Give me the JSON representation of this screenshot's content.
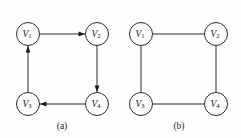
{
  "figure": {
    "background_color": "#fefefe",
    "stroke_color": "#2b2b2b",
    "text_color": "#151515",
    "panels": [
      {
        "id": "panel-a",
        "caption": "(a)",
        "graph_type": "directed",
        "nodes": [
          {
            "id": "V1",
            "label_main": "V",
            "label_sub": "1",
            "cx": 28,
            "cy": 34,
            "r": 11.5
          },
          {
            "id": "V2",
            "label_main": "V",
            "label_sub": "2",
            "cx": 97,
            "cy": 34,
            "r": 11.5
          },
          {
            "id": "V3",
            "label_main": "V",
            "label_sub": "3",
            "cx": 28,
            "cy": 104,
            "r": 11.5
          },
          {
            "id": "V4",
            "label_main": "V",
            "label_sub": "4",
            "cx": 97,
            "cy": 104,
            "r": 11.5
          }
        ],
        "edges": [
          {
            "id": "e-v1-v2",
            "from": "V1",
            "to": "V2",
            "directed": true,
            "arrow_at": "to"
          },
          {
            "id": "e-v2-v4",
            "from": "V2",
            "to": "V4",
            "directed": true,
            "arrow_at": "to"
          },
          {
            "id": "e-v4-v3",
            "from": "V4",
            "to": "V3",
            "directed": true,
            "arrow_at": "to"
          },
          {
            "id": "e-v3-v1",
            "from": "V3",
            "to": "V1",
            "directed": true,
            "arrow_at": "to"
          }
        ],
        "caption_x": 62,
        "caption_y": 127
      },
      {
        "id": "panel-b",
        "caption": "(b)",
        "graph_type": "undirected",
        "nodes": [
          {
            "id": "V1",
            "label_main": "V",
            "label_sub": "1",
            "cx": 141,
            "cy": 34,
            "r": 11.5
          },
          {
            "id": "V2",
            "label_main": "V",
            "label_sub": "2",
            "cx": 216,
            "cy": 34,
            "r": 11.5
          },
          {
            "id": "V3",
            "label_main": "V",
            "label_sub": "3",
            "cx": 141,
            "cy": 104,
            "r": 11.5
          },
          {
            "id": "V4",
            "label_main": "V",
            "label_sub": "4",
            "cx": 216,
            "cy": 104,
            "r": 11.5
          }
        ],
        "edges": [
          {
            "id": "e-v1-v2",
            "from": "V1",
            "to": "V2",
            "directed": false,
            "arrow_at": "none"
          },
          {
            "id": "e-v2-v4",
            "from": "V2",
            "to": "V4",
            "directed": false,
            "arrow_at": "none"
          },
          {
            "id": "e-v4-v3",
            "from": "V4",
            "to": "V3",
            "directed": false,
            "arrow_at": "none"
          },
          {
            "id": "e-v3-v1",
            "from": "V3",
            "to": "V1",
            "directed": false,
            "arrow_at": "none"
          }
        ],
        "caption_x": 179,
        "caption_y": 127
      }
    ]
  }
}
